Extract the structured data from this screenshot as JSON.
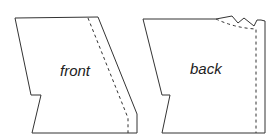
{
  "diagram": {
    "title": "",
    "pieces": [
      {
        "id": "front",
        "label": "front"
      },
      {
        "id": "back",
        "label": "back"
      }
    ],
    "colors": {
      "line": "#333333",
      "background": "#ffffff"
    }
  }
}
